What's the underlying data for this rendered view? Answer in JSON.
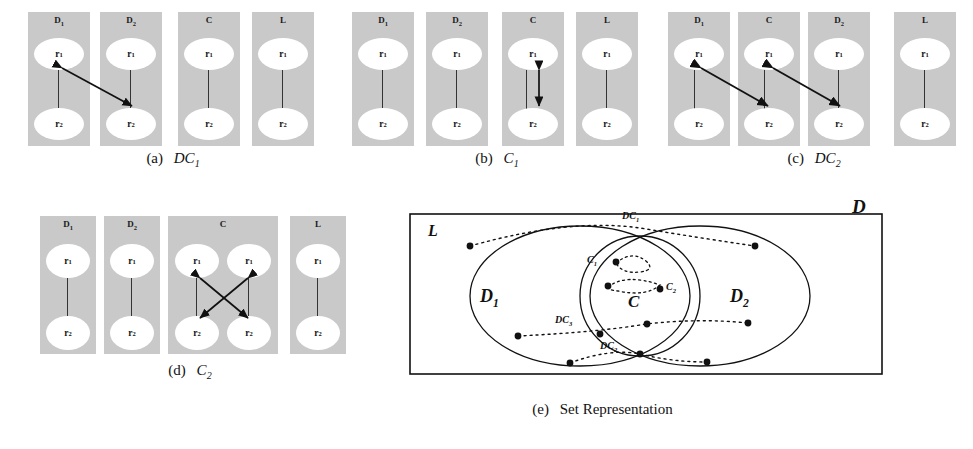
{
  "figure": {
    "node_labels": {
      "r1": "r",
      "r1_sub": "1",
      "r2": "r",
      "r2_sub": "2"
    },
    "colors": {
      "panel_fill": "#c9c9c9",
      "node_fill": "#ffffff",
      "line": "#333333",
      "stroke": "#111111",
      "background": "#ffffff"
    }
  },
  "subfigures": [
    {
      "id": "a",
      "caption_prefix": "(a)",
      "caption_symbol": "DC",
      "caption_sub": "1",
      "panels": [
        {
          "title": "D",
          "title_sub": "1",
          "columns": 1
        },
        {
          "title": "D",
          "title_sub": "2",
          "columns": 1
        },
        {
          "title": "C",
          "title_sub": "",
          "columns": 1
        },
        {
          "title": "L",
          "title_sub": "",
          "columns": 1
        }
      ],
      "arrows": [
        {
          "from": "panel0.r1",
          "to": "panel1.r2",
          "style": "double-headed",
          "kind": "cross-panel"
        }
      ]
    },
    {
      "id": "b",
      "caption_prefix": "(b)",
      "caption_symbol": "C",
      "caption_sub": "1",
      "panels": [
        {
          "title": "D",
          "title_sub": "1",
          "columns": 1
        },
        {
          "title": "D",
          "title_sub": "2",
          "columns": 1
        },
        {
          "title": "C",
          "title_sub": "",
          "columns": 1
        },
        {
          "title": "L",
          "title_sub": "",
          "columns": 1
        }
      ],
      "arrows": [
        {
          "from": "panel2.r1",
          "to": "panel2.r2",
          "style": "double-headed",
          "kind": "in-panel"
        }
      ]
    },
    {
      "id": "c",
      "caption_prefix": "(c)",
      "caption_symbol": "DC",
      "caption_sub": "2",
      "panels": [
        {
          "title": "D",
          "title_sub": "1",
          "columns": 1
        },
        {
          "title": "C",
          "title_sub": "",
          "columns": 1
        },
        {
          "title": "D",
          "title_sub": "2",
          "columns": 1
        },
        {
          "title": "L",
          "title_sub": "",
          "columns": 1
        }
      ],
      "arrows": [
        {
          "from": "panel0.r1",
          "to": "panel1.r2",
          "style": "double-headed",
          "kind": "cross-panel"
        },
        {
          "from": "panel1.r1",
          "to": "panel2.r2",
          "style": "double-headed",
          "kind": "cross-panel"
        }
      ]
    },
    {
      "id": "d",
      "caption_prefix": "(d)",
      "caption_symbol": "C",
      "caption_sub": "2",
      "panels": [
        {
          "title": "D",
          "title_sub": "1",
          "columns": 1
        },
        {
          "title": "D",
          "title_sub": "2",
          "columns": 1
        },
        {
          "title": "C",
          "title_sub": "",
          "columns": 2
        },
        {
          "title": "L",
          "title_sub": "",
          "columns": 1
        }
      ],
      "arrows": [
        {
          "from": "panel2.colA.r1",
          "to": "panel2.colB.r2",
          "style": "double-headed",
          "kind": "in-panel-cross"
        },
        {
          "from": "panel2.colB.r1",
          "to": "panel2.colA.r2",
          "style": "double-headed",
          "kind": "in-panel-cross"
        }
      ]
    }
  ],
  "venn": {
    "caption_prefix": "(e)",
    "caption_text": "Set Representation",
    "outer_box_label": "D",
    "universe_label": "L",
    "left_set_label": "D",
    "left_set_sub": "1",
    "right_set_label": "D",
    "right_set_sub": "2",
    "center_set_label": "C",
    "annotations": [
      {
        "label": "DC",
        "sub": "1",
        "x": 238,
        "y": 20
      },
      {
        "label": "C",
        "sub": "1",
        "x": 180,
        "y": 62
      },
      {
        "label": "C",
        "sub": "2",
        "x": 245,
        "y": 90
      },
      {
        "label": "DC",
        "sub": "3",
        "x": 163,
        "y": 140
      },
      {
        "label": "DC",
        "sub": "2",
        "x": 205,
        "y": 172
      }
    ]
  }
}
